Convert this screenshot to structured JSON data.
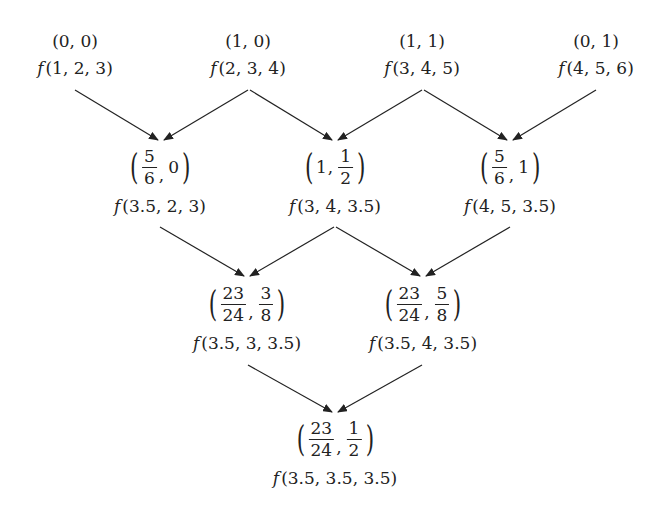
{
  "diagram": {
    "type": "binary-merge-tree",
    "stroke_color": "#222222",
    "background": "#ffffff",
    "rows": [
      {
        "nodes": [
          {
            "id": "n00",
            "point": "(0, 0)",
            "func": "(1, 2, 3)"
          },
          {
            "id": "n10",
            "point": "(1, 0)",
            "func": "(2, 3, 4)"
          },
          {
            "id": "n11",
            "point": "(1, 1)",
            "func": "(3, 4, 5)"
          },
          {
            "id": "n01",
            "point": "(0, 1)",
            "func": "(4, 5, 6)"
          }
        ]
      },
      {
        "nodes": [
          {
            "id": "a",
            "point_parts": {
              "x_num": "5",
              "x_den": "6",
              "y": "0"
            },
            "func": "(3.5, 2, 3)"
          },
          {
            "id": "b",
            "point_parts": {
              "x": "1",
              "y_num": "1",
              "y_den": "2"
            },
            "func": "(3, 4, 3.5)"
          },
          {
            "id": "c",
            "point_parts": {
              "x_num": "5",
              "x_den": "6",
              "y": "1"
            },
            "func": "(4, 5, 3.5)"
          }
        ]
      },
      {
        "nodes": [
          {
            "id": "d",
            "point_parts": {
              "x_num": "23",
              "x_den": "24",
              "y_num": "3",
              "y_den": "8"
            },
            "func": "(3.5, 3, 3.5)"
          },
          {
            "id": "e",
            "point_parts": {
              "x_num": "23",
              "x_den": "24",
              "y_num": "5",
              "y_den": "8"
            },
            "func": "(3.5, 4, 3.5)"
          }
        ]
      },
      {
        "nodes": [
          {
            "id": "g",
            "point_parts": {
              "x_num": "23",
              "x_den": "24",
              "y_num": "1",
              "y_den": "2"
            },
            "func": "(3.5, 3.5, 3.5)"
          }
        ]
      }
    ],
    "function_symbol": "f",
    "edges": [
      {
        "from": "n00",
        "to": "a"
      },
      {
        "from": "n10",
        "to": "a"
      },
      {
        "from": "n10",
        "to": "b"
      },
      {
        "from": "n11",
        "to": "b"
      },
      {
        "from": "n11",
        "to": "c"
      },
      {
        "from": "n01",
        "to": "c"
      },
      {
        "from": "a",
        "to": "d"
      },
      {
        "from": "b",
        "to": "d"
      },
      {
        "from": "b",
        "to": "e"
      },
      {
        "from": "c",
        "to": "e"
      },
      {
        "from": "d",
        "to": "g"
      },
      {
        "from": "e",
        "to": "g"
      }
    ],
    "separator": ",",
    "paren_open": "(",
    "paren_close": ")"
  }
}
